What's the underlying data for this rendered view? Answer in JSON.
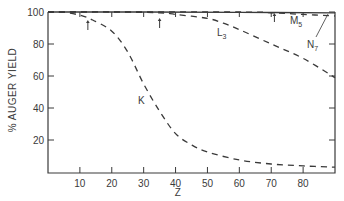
{
  "chart_data": {
    "type": "line",
    "title": "",
    "xlabel": "Z",
    "ylabel": "% AUGER YIELD",
    "xlim": [
      0,
      90
    ],
    "ylim": [
      0,
      100
    ],
    "x_ticks": [
      10,
      20,
      30,
      40,
      50,
      60,
      70,
      80
    ],
    "y_ticks": [
      20,
      40,
      60,
      80,
      100
    ],
    "grid": false,
    "legend": "inline labels",
    "series": [
      {
        "name": "K",
        "style": "dashed",
        "x": [
          0,
          5,
          10,
          14,
          20,
          25,
          30,
          35,
          40,
          45,
          50,
          60,
          70,
          80,
          90
        ],
        "values": [
          100,
          99.8,
          98,
          95,
          88,
          75,
          55,
          38,
          24,
          17,
          12.5,
          7.5,
          5,
          3.8,
          3
        ]
      },
      {
        "name": "L3",
        "style": "dashed",
        "x": [
          0,
          20,
          35,
          40,
          50,
          55,
          60,
          70,
          80,
          90
        ],
        "values": [
          100,
          100,
          99.5,
          98.5,
          96,
          93,
          89,
          80,
          71,
          59
        ]
      },
      {
        "name": "M5",
        "style": "dashed",
        "x": [
          0,
          60,
          70,
          80,
          90
        ],
        "values": [
          100,
          100,
          99.5,
          98.5,
          97.5
        ]
      },
      {
        "name": "N7",
        "style": "solid",
        "x": [
          0,
          30,
          60,
          90
        ],
        "values": [
          100,
          100,
          99.8,
          99.5
        ]
      }
    ],
    "annotations": [
      {
        "type": "arrow",
        "x": 12.5,
        "label": ""
      },
      {
        "type": "arrow",
        "x": 35,
        "label": ""
      },
      {
        "type": "arrow",
        "x": 71,
        "label": ""
      }
    ],
    "labels": {
      "K": "K",
      "L3_main": "L",
      "L3_sub": "3",
      "M5_main": "M",
      "M5_sub": "5",
      "N7_main": "N",
      "N7_sub": "7"
    },
    "tick_text": {
      "x": [
        "10",
        "20",
        "30",
        "40",
        "50",
        "60",
        "70",
        "80"
      ],
      "y": [
        "20",
        "40",
        "60",
        "80",
        "100"
      ]
    }
  }
}
